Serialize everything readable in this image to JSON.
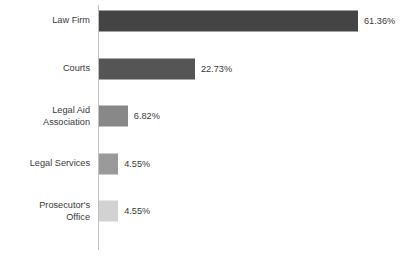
{
  "chart_data": {
    "type": "bar",
    "orientation": "horizontal",
    "title": "",
    "subtitle": "",
    "xlabel": "",
    "ylabel": "",
    "grid": false,
    "legend": "none",
    "xlim": [
      0,
      61.36
    ],
    "categories": [
      "Law Firm",
      "Courts",
      "Legal Aid\nAssociation",
      "Legal Services",
      "Prosecutor's\nOffice"
    ],
    "values": [
      61.36,
      22.73,
      6.82,
      4.55,
      4.55
    ],
    "value_labels": [
      "61.36%",
      "22.73%",
      "6.82%",
      "4.55%",
      "4.55%"
    ],
    "bar_colors": [
      "#444444",
      "#555555",
      "#888888",
      "#9a9a9a",
      "#d2d2d2"
    ],
    "axis_color": "#bfbfbf",
    "text_color": "#3a3a3a",
    "background": "#ffffff"
  }
}
